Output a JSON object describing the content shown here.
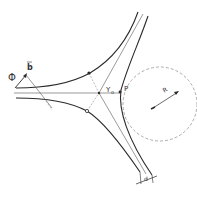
{
  "diagram": {
    "type": "geometric-schematic",
    "labels": {
      "phi": "Φ",
      "b_vector": "b",
      "y0": "Y",
      "y0_sub": "o",
      "p": "P",
      "r": "R",
      "d": "d"
    },
    "colors": {
      "stroke": "#2a2a2a",
      "thin": "#555555",
      "dashed": "#8a8a8a",
      "background": "#ffffff"
    }
  }
}
